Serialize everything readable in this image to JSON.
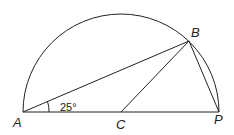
{
  "diagram": {
    "type": "semicircle-geometry",
    "points": {
      "A": {
        "label": "A"
      },
      "B": {
        "label": "B"
      },
      "C": {
        "label": "C"
      },
      "P": {
        "label": "P"
      }
    },
    "angle_label": "25°",
    "colors": {
      "stroke": "#222222",
      "background": "#ffffff"
    }
  }
}
